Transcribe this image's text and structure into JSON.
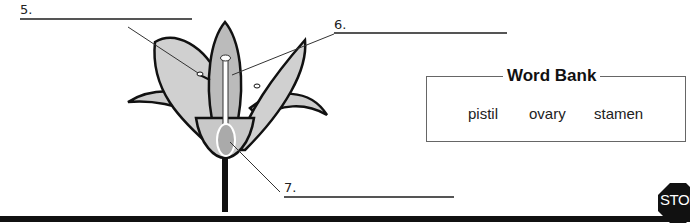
{
  "labels": [
    {
      "number": "5.",
      "target": "stamen (pointer)"
    },
    {
      "number": "6.",
      "target": "pistil (pointer)"
    },
    {
      "number": "7.",
      "target": "ovary (pointer)"
    }
  ],
  "word_bank": {
    "title": "Word Bank",
    "words": [
      "pistil",
      "ovary",
      "stamen"
    ]
  },
  "stop_sign": {
    "text": "STOP"
  },
  "colors": {
    "petal": "#c8c8c8",
    "outline": "#111111",
    "line": "#555555"
  }
}
